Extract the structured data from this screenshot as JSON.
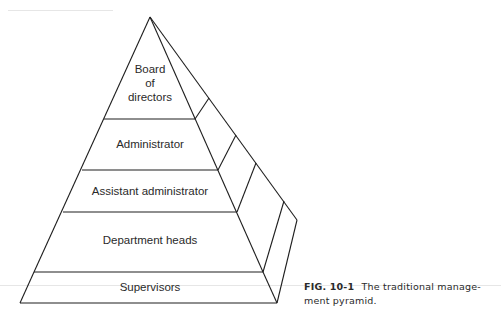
{
  "figure": {
    "type": "pyramid-diagram",
    "levels": [
      {
        "label_lines": [
          "Board",
          "of",
          "directors"
        ]
      },
      {
        "label": "Administrator"
      },
      {
        "label": "Assistant administrator"
      },
      {
        "label": "Department heads"
      },
      {
        "label": "Supervisors"
      }
    ],
    "caption": {
      "number": "FIG. 10-1",
      "text": "The traditional management pyramid.",
      "line1": "The traditional manage-",
      "line2": "ment pyramid."
    },
    "colors": {
      "stroke": "#1e1e1e",
      "text": "#2a2a2a",
      "background": "#ffffff"
    }
  }
}
